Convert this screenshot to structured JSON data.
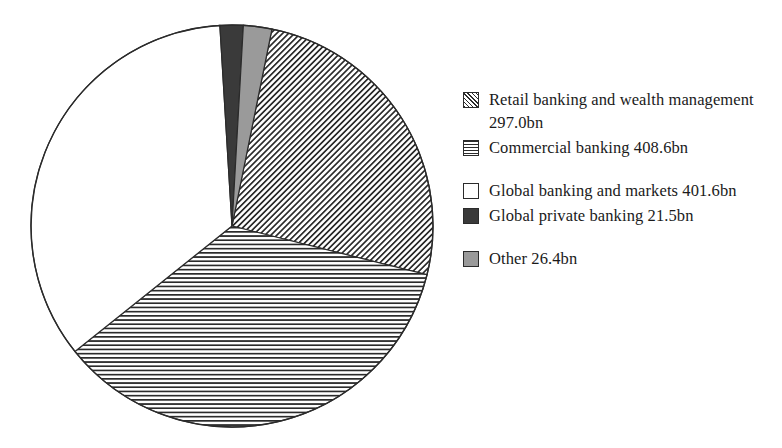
{
  "chart_data": {
    "type": "pie",
    "title": "",
    "subtitle": "",
    "xlabel": "",
    "ylabel": "",
    "unit": "bn",
    "total": 1155.1,
    "legend_position": "right",
    "grid": false,
    "categories": [
      "Retail banking and wealth management",
      "Commercial banking",
      "Global banking and markets",
      "Global private banking",
      "Other"
    ],
    "values": [
      297.0,
      408.6,
      401.6,
      21.5,
      26.4
    ],
    "slices": [
      {
        "label": "Retail banking and wealth management",
        "value": 297.0,
        "value_text": "297.0bn",
        "legend_text": "Retail banking and wealth management 297.0bn",
        "percent": 25.71,
        "angle_deg": 92.56,
        "start_angle_deg": 11.48,
        "end_angle_deg": 104.04,
        "fill": "diagonal-hatch",
        "color": "#2b2b2b",
        "swatch": "sw-diag"
      },
      {
        "label": "Commercial banking",
        "value": 408.6,
        "value_text": "408.6bn",
        "legend_text": "Commercial banking 408.6bn",
        "percent": 35.37,
        "angle_deg": 127.34,
        "start_angle_deg": 104.04,
        "end_angle_deg": 231.38,
        "fill": "horizontal-stripes",
        "color": "#2b2b2b",
        "swatch": "sw-horiz"
      },
      {
        "label": "Global banking and markets",
        "value": 401.6,
        "value_text": "401.6bn",
        "legend_text": "Global banking and markets 401.6bn",
        "percent": 34.77,
        "angle_deg": 125.16,
        "start_angle_deg": 231.38,
        "end_angle_deg": 356.54,
        "fill": "solid",
        "color": "#ffffff",
        "swatch": "sw-white"
      },
      {
        "label": "Global private banking",
        "value": 21.5,
        "value_text": "21.5bn",
        "legend_text": "Global private banking 21.5bn",
        "percent": 1.86,
        "angle_deg": 6.7,
        "start_angle_deg": 356.54,
        "end_angle_deg": 3.24,
        "fill": "solid",
        "color": "#3a3a3a",
        "swatch": "sw-dark"
      },
      {
        "label": "Other",
        "value": 26.4,
        "value_text": "26.4bn",
        "legend_text": "Other 26.4bn",
        "percent": 2.29,
        "angle_deg": 8.23,
        "start_angle_deg": 3.24,
        "end_angle_deg": 11.48,
        "fill": "solid",
        "color": "#9a9a9a",
        "swatch": "sw-gray"
      }
    ]
  },
  "pie": {
    "center_x": 232,
    "center_y": 226,
    "radius": 201,
    "outline_color": "#2b2b2b"
  },
  "legend": {
    "entries": [
      {
        "text": "Retail banking and wealth management 297.0bn",
        "swatch": "sw-diag",
        "icon": "diagonal-hatch-swatch-icon",
        "gap_before": false
      },
      {
        "text": "Commercial banking 408.6bn",
        "swatch": "sw-horiz",
        "icon": "horizontal-stripe-swatch-icon",
        "gap_before": false
      },
      {
        "text": "Global banking and markets 401.6bn",
        "swatch": "sw-white",
        "icon": "white-swatch-icon",
        "gap_before": true
      },
      {
        "text": "Global private banking 21.5bn",
        "swatch": "sw-dark",
        "icon": "dark-swatch-icon",
        "gap_before": false
      },
      {
        "text": "Other 26.4bn",
        "swatch": "sw-gray",
        "icon": "gray-swatch-icon",
        "gap_before": true
      }
    ]
  }
}
